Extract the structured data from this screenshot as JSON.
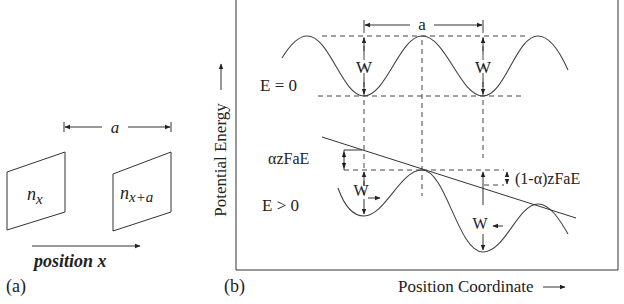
{
  "panel_a": {
    "label": "(a)",
    "spacing_label": "a",
    "plane_left_label": "n",
    "plane_left_sub": "x",
    "plane_right_label": "n",
    "plane_right_sub": "x+a",
    "axis_label": "position x"
  },
  "panel_b": {
    "label": "(b)",
    "y_axis_label": "Potential Energy",
    "x_axis_label": "Position Coordinate",
    "spacing_label": "a",
    "top_state_label": "E = 0",
    "bottom_state_label": "E > 0",
    "barrier_label": "W",
    "forward_shift_label": "αzFaE",
    "reverse_shift_label": "(1-α)zFaE"
  }
}
